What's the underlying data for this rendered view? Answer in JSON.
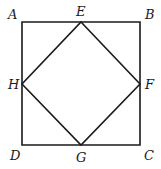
{
  "diagram": {
    "type": "geometry",
    "stroke_color": "#1a1a1a",
    "background": "#ffffff",
    "points": {
      "A": {
        "x": 22,
        "y": 22,
        "label": "A",
        "lx": 8,
        "ly": 19
      },
      "B": {
        "x": 140,
        "y": 22,
        "label": "B",
        "lx": 145,
        "ly": 19
      },
      "C": {
        "x": 140,
        "y": 145,
        "label": "C",
        "lx": 144,
        "ly": 160
      },
      "D": {
        "x": 22,
        "y": 145,
        "label": "D",
        "lx": 10,
        "ly": 160
      },
      "E": {
        "x": 81,
        "y": 22,
        "label": "E",
        "lx": 76,
        "ly": 16
      },
      "F": {
        "x": 140,
        "y": 84,
        "label": "F",
        "lx": 145,
        "ly": 89
      },
      "G": {
        "x": 81,
        "y": 145,
        "label": "G",
        "lx": 76,
        "ly": 162
      },
      "H": {
        "x": 22,
        "y": 84,
        "label": "H",
        "lx": 8,
        "ly": 89
      }
    },
    "outer_square": [
      "A",
      "B",
      "C",
      "D"
    ],
    "inner_square": [
      "E",
      "F",
      "G",
      "H"
    ],
    "labels": [
      "A",
      "B",
      "C",
      "D",
      "E",
      "F",
      "G",
      "H"
    ]
  }
}
